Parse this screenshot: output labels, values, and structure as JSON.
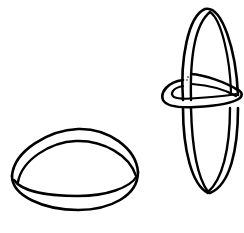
{
  "figure": {
    "stroke_color": "#000000",
    "background_color": "#ffffff",
    "objects": [
      {
        "name": "flat-ring",
        "position": "bottom-left"
      },
      {
        "name": "interlocked-rings",
        "position": "right",
        "parts": [
          "vertical-ring",
          "horizontal-ring"
        ]
      }
    ]
  }
}
